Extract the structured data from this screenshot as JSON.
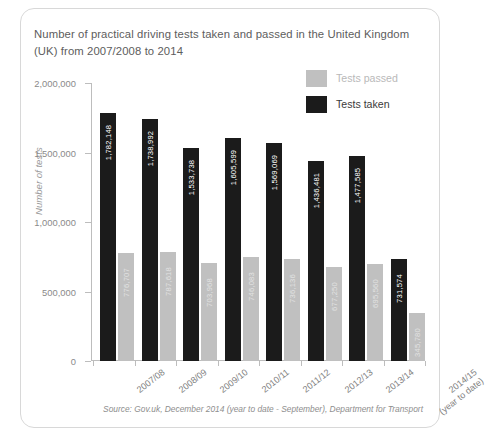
{
  "title": "Number of practical driving tests taken and\npassed in the United Kingdom (UK) from 2007/2008 to 2014",
  "legend": {
    "items": [
      {
        "label": "Tests passed",
        "color": "#c0c0c0",
        "key": "passed"
      },
      {
        "label": "Tests taken",
        "color": "#1b1b1b",
        "key": "taken"
      }
    ]
  },
  "source": "Source: Gov.uk, December 2014 (year to date - September), Department for Transport",
  "chart_data": {
    "type": "bar",
    "title": "Number of practical driving tests taken and passed in the United Kingdom (UK) from 2007/2008 to 2014",
    "xlabel": "",
    "ylabel": "Number of tests",
    "ylim": [
      0,
      2000000
    ],
    "yticks": [
      0,
      500000,
      1000000,
      1500000,
      2000000
    ],
    "ytick_labels": [
      "0",
      "500,000",
      "1,000,000",
      "1,500,000",
      "2,000,000"
    ],
    "grid": false,
    "legend_position": "top-right",
    "categories": [
      "2007/08",
      "2008/09",
      "2009/10",
      "2010/11",
      "2011/12",
      "2012/13",
      "2013/14",
      "2014/15\n(year to date)"
    ],
    "series": [
      {
        "name": "Tests taken",
        "color": "#1b1b1b",
        "values": [
          1782148,
          1738992,
          1533738,
          1605599,
          1569069,
          1436481,
          1477585,
          731574
        ],
        "labels": [
          "1,782,148",
          "1,738,992",
          "1,533,738",
          "1,605,599",
          "1,569,069",
          "1,436,481",
          "1,477,585",
          "731,574"
        ]
      },
      {
        "name": "Tests passed",
        "color": "#c0c0c0",
        "values": [
          776707,
          787618,
          703968,
          746083,
          736136,
          677250,
          695560,
          345780
        ],
        "labels": [
          "776,707",
          "787,618",
          "703,968",
          "746,083",
          "736,136",
          "677,250",
          "695,560",
          "345,780"
        ]
      }
    ]
  }
}
